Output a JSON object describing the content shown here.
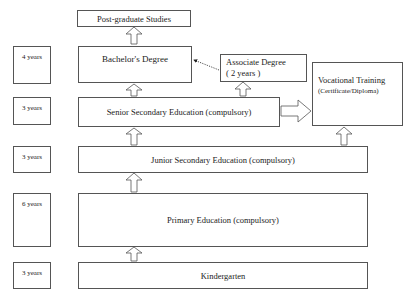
{
  "diagram": {
    "levels": [
      {
        "id": "postgrad",
        "label": "Post-graduate Studies"
      },
      {
        "id": "bachelor",
        "label": "Bachelor's Degree",
        "duration": "4 years"
      },
      {
        "id": "associate",
        "label": "Associate Degree",
        "sublabel": "( 2 years )"
      },
      {
        "id": "vocational",
        "label": "Vocational Training",
        "sublabel": "(Certificate/Diploma)"
      },
      {
        "id": "senior",
        "label": "Senior Secondary Education (compulsory)",
        "duration": "3 years"
      },
      {
        "id": "junior",
        "label": "Junior Secondary Education (compulsory)",
        "duration": "3 years"
      },
      {
        "id": "primary",
        "label": "Primary Education (compulsory)",
        "duration": "6 years"
      },
      {
        "id": "kindergarten",
        "label": "Kindergarten",
        "duration": "3 years"
      }
    ],
    "connections": [
      {
        "from": "kindergarten",
        "to": "primary",
        "style": "hollow-arrow"
      },
      {
        "from": "primary",
        "to": "junior",
        "style": "hollow-arrow"
      },
      {
        "from": "junior",
        "to": "senior",
        "style": "hollow-arrow"
      },
      {
        "from": "junior",
        "to": "vocational",
        "style": "hollow-arrow"
      },
      {
        "from": "senior",
        "to": "bachelor",
        "style": "hollow-arrow"
      },
      {
        "from": "senior",
        "to": "associate",
        "style": "hollow-arrow"
      },
      {
        "from": "senior",
        "to": "vocational",
        "style": "hollow-arrow"
      },
      {
        "from": "bachelor",
        "to": "postgrad",
        "style": "hollow-arrow"
      },
      {
        "from": "associate",
        "to": "bachelor",
        "style": "dotted-arrow"
      }
    ]
  }
}
